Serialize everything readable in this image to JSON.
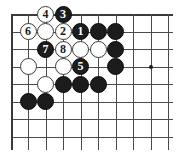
{
  "figure": {
    "kind": "go-board-diagram",
    "background_color": "#ffffff",
    "line_color": "#4a4a4a",
    "edge_color": "#3a3a3a",
    "black_stone_color": "#1c1c1c",
    "white_stone_color": "#ffffff",
    "black_label_color": "#ffffff",
    "white_label_color": "#1c1c1c"
  },
  "board": {
    "columns": 9,
    "rows": 8,
    "spacing": 17.5,
    "origin_x": 28,
    "origin_y": 14,
    "has_top_edge": true,
    "has_left_edge": true,
    "star_points": [
      {
        "col": 7,
        "row": 3
      }
    ]
  },
  "stones": [
    {
      "col": 1,
      "row": 0,
      "color": "white",
      "label": "4"
    },
    {
      "col": 2,
      "row": 0,
      "color": "black",
      "label": "3"
    },
    {
      "col": 0,
      "row": 1,
      "color": "white",
      "label": "6"
    },
    {
      "col": 1,
      "row": 1,
      "color": "white",
      "label": ""
    },
    {
      "col": 2,
      "row": 1,
      "color": "white",
      "label": "2"
    },
    {
      "col": 3,
      "row": 1,
      "color": "black",
      "label": "1"
    },
    {
      "col": 4,
      "row": 1,
      "color": "black",
      "label": ""
    },
    {
      "col": 5,
      "row": 1,
      "color": "black",
      "label": ""
    },
    {
      "col": 1,
      "row": 2,
      "color": "black",
      "label": "7"
    },
    {
      "col": 2,
      "row": 2,
      "color": "white",
      "label": "8"
    },
    {
      "col": 3,
      "row": 2,
      "color": "white",
      "label": ""
    },
    {
      "col": 4,
      "row": 2,
      "color": "white",
      "label": ""
    },
    {
      "col": 5,
      "row": 2,
      "color": "black",
      "label": ""
    },
    {
      "col": 0,
      "row": 3,
      "color": "white",
      "label": ""
    },
    {
      "col": 2,
      "row": 3,
      "color": "white",
      "label": ""
    },
    {
      "col": 3,
      "row": 3,
      "color": "black",
      "label": "5"
    },
    {
      "col": 5,
      "row": 3,
      "color": "black",
      "label": ""
    },
    {
      "col": 1,
      "row": 4,
      "color": "white",
      "label": ""
    },
    {
      "col": 2,
      "row": 4,
      "color": "black",
      "label": ""
    },
    {
      "col": 3,
      "row": 4,
      "color": "black",
      "label": ""
    },
    {
      "col": 4,
      "row": 4,
      "color": "black",
      "label": ""
    },
    {
      "col": 0,
      "row": 5,
      "color": "black",
      "label": ""
    },
    {
      "col": 1,
      "row": 5,
      "color": "black",
      "label": ""
    }
  ]
}
